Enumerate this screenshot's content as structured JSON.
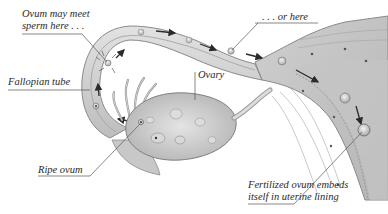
{
  "diagram": {
    "labels": {
      "ovum_may_meet_line1": "Ovum may meet",
      "ovum_may_meet_line2": "sperm here . . .",
      "or_here": ". . . or here",
      "fallopian_tube": "Fallopian tube",
      "ovary": "Ovary",
      "ripe_ovum": "Ripe ovum",
      "fertilized_line1": "Fertilized ovum embeds",
      "fertilized_line2": "itself in uterine lining"
    },
    "structures": [
      "fallopian-tube",
      "ovary",
      "fimbriae",
      "uterine-wall",
      "uterine-lining"
    ],
    "colors": {
      "tissue_light": "#d9d9d9",
      "tissue_mid": "#b8b8b8",
      "tissue_dark": "#8e8e8e",
      "outline": "#7a7a7a",
      "arrow": "#2b2b2b",
      "leader_line": "#555555",
      "text": "#2a2a2a"
    }
  }
}
